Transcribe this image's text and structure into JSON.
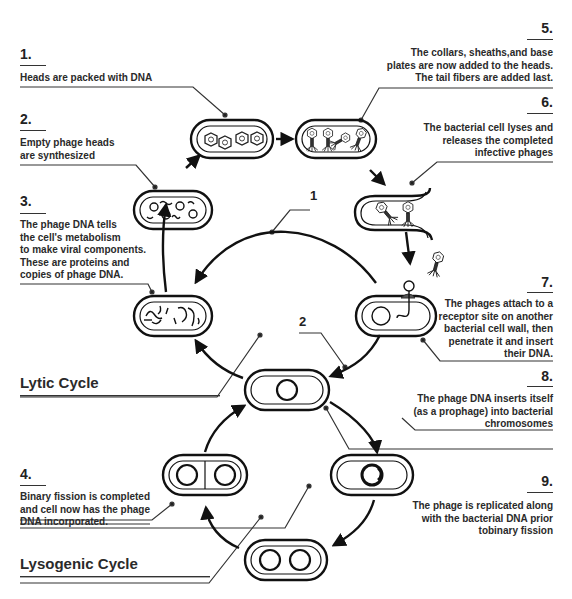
{
  "diagram": {
    "cycles": {
      "lytic": "Lytic Cycle",
      "lysogenic": "Lysogenic Cycle"
    },
    "path_labels": [
      "1",
      "2"
    ],
    "steps": [
      {
        "number": "1.",
        "text": "Heads are packed with DNA"
      },
      {
        "number": "2.",
        "text": "Empty phage heads\nare synthesized"
      },
      {
        "number": "3.",
        "text": "The phage DNA tells\nthe cell's metabolism\nto make viral components.\nThese are proteins and\ncopies of phage DNA."
      },
      {
        "number": "4.",
        "text": "Binary fission is completed\nand cell now has the phage\nDNA incorporated."
      },
      {
        "number": "5.",
        "text": "The collars, sheaths,and base\nplates are now added to the heads.\nThe tail fibers are added last."
      },
      {
        "number": "6.",
        "text": "The bacterial cell lyses and\nreleases the completed\ninfective phages"
      },
      {
        "number": "7.",
        "text": "The phages attach to a\nreceptor site on another\nbacterial cell wall, then\npenetrate it and insert\ntheir DNA."
      },
      {
        "number": "8.",
        "text": "The phage DNA inserts itself\n(as a prophage) into bacterial\nchromosomes"
      },
      {
        "number": "9.",
        "text": "The phage is replicated along\nwith the bacterial DNA prior\ntobinary fission"
      }
    ]
  }
}
